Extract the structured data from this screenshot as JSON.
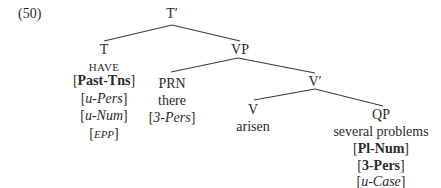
{
  "example_number": "(50)",
  "tree": {
    "root": {
      "label": "T′"
    },
    "T": {
      "label": "T",
      "lexical": "HAVE",
      "features": [
        {
          "open": "[",
          "text": "Past-Tns",
          "close": "]",
          "style": "bold"
        },
        {
          "open": "[",
          "text": "u-Pers",
          "close": "]",
          "style": "italic"
        },
        {
          "open": "[",
          "text": "u-Num",
          "close": "]",
          "style": "italic"
        },
        {
          "open": "[",
          "text": "EPP",
          "close": "]",
          "style": "italic-small"
        }
      ]
    },
    "VP": {
      "label": "VP"
    },
    "PRN": {
      "label": "PRN",
      "lexical": "there",
      "features": [
        {
          "open": "[",
          "text": "3-Pers",
          "close": "]",
          "style": "italic"
        }
      ]
    },
    "V_bar": {
      "label": "V′"
    },
    "V": {
      "label": "V",
      "lexical": "arisen"
    },
    "QP": {
      "label": "QP",
      "lexical": "several problems",
      "features": [
        {
          "open": "[",
          "text": "Pl-Num",
          "close": "]",
          "style": "bold"
        },
        {
          "open": "[",
          "text": "3-Pers",
          "close": "]",
          "style": "bold"
        },
        {
          "open": "[",
          "text": "u-Case",
          "close": "]",
          "style": "italic"
        }
      ]
    }
  },
  "colors": {
    "line": "#3a3a3a",
    "text": "#2a2a2a",
    "background": "#ffffff"
  }
}
